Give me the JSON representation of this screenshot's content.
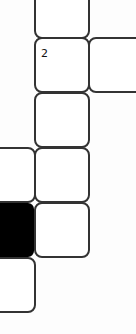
{
  "puzzle": {
    "type": "crossword-fragment",
    "cells": [
      {
        "id": "c1",
        "col": 1,
        "row": 0,
        "fill": "white",
        "number": ""
      },
      {
        "id": "c2",
        "col": 1,
        "row": 1,
        "fill": "white",
        "number": "2"
      },
      {
        "id": "c3",
        "col": 2,
        "row": 1,
        "fill": "white",
        "number": ""
      },
      {
        "id": "c4",
        "col": 1,
        "row": 2,
        "fill": "white",
        "number": ""
      },
      {
        "id": "c5",
        "col": 0,
        "row": 3,
        "fill": "white",
        "number": ""
      },
      {
        "id": "c6",
        "col": 1,
        "row": 3,
        "fill": "white",
        "number": ""
      },
      {
        "id": "c7",
        "col": 0,
        "row": 4,
        "fill": "black",
        "number": ""
      },
      {
        "id": "c8",
        "col": 1,
        "row": 4,
        "fill": "white",
        "number": ""
      },
      {
        "id": "c9",
        "col": 0,
        "row": 5,
        "fill": "white",
        "number": ""
      }
    ],
    "colors": {
      "border": "#333333",
      "block": "#000000",
      "background": "#fdfdfd"
    }
  }
}
